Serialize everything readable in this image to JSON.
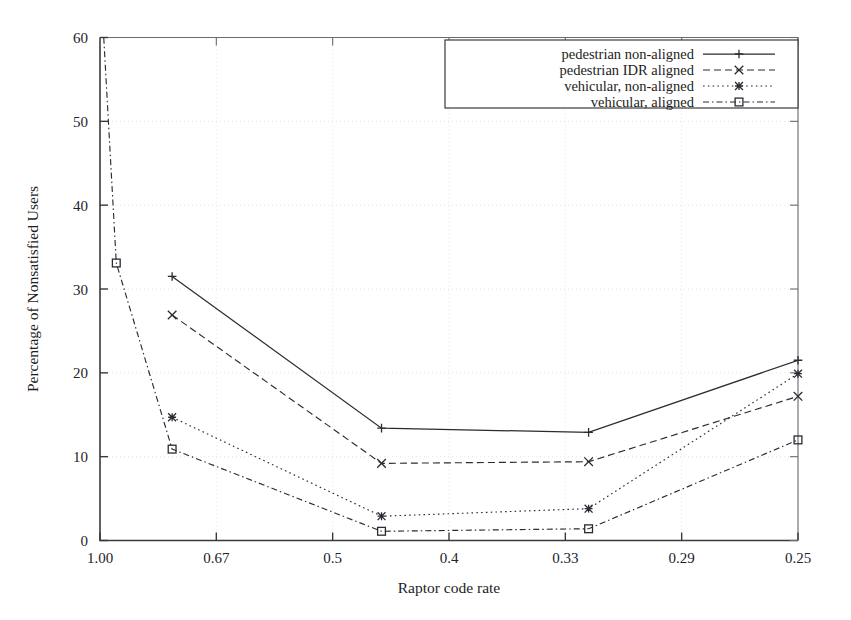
{
  "chart_data": {
    "type": "line",
    "title": "",
    "xlabel": "Raptor code rate",
    "ylabel": "Percentage of Nonsatisfied Users",
    "x_ticklabels": [
      "1.00",
      "0.67",
      "0.5",
      "0.4",
      "0.33",
      "0.29",
      "0.25"
    ],
    "x_tickvalues": [
      1,
      2,
      3,
      4,
      5,
      6,
      7
    ],
    "xlim": [
      1,
      7
    ],
    "y_ticklabels": [
      "0",
      "10",
      "20",
      "30",
      "40",
      "50",
      "60"
    ],
    "y_tickvalues": [
      0,
      10,
      20,
      30,
      40,
      50,
      60
    ],
    "ylim": [
      0,
      60
    ],
    "grid": true,
    "legend_position": "top-right",
    "x": [
      1.0,
      1.62,
      3.42,
      5.2,
      7.0
    ],
    "series": [
      {
        "name": "pedestrian non-aligned",
        "marker": "plus",
        "dash": "solid",
        "x": [
          1.62,
          3.42,
          5.2,
          7.0
        ],
        "values": [
          31.5,
          13.4,
          12.9,
          21.5
        ]
      },
      {
        "name": "pedestrian IDR aligned",
        "marker": "cross",
        "dash": "dashed",
        "x": [
          1.62,
          3.42,
          5.2,
          7.0
        ],
        "values": [
          26.9,
          9.2,
          9.4,
          17.2
        ]
      },
      {
        "name": "vehicular, non-aligned",
        "marker": "star",
        "dash": "dotted",
        "x": [
          1.62,
          3.42,
          5.2,
          7.0
        ],
        "values": [
          14.7,
          2.9,
          3.8,
          19.9
        ]
      },
      {
        "name": "vehicular, aligned",
        "marker": "square",
        "dash": "dashdot",
        "x": [
          1.0,
          1.14,
          1.62,
          3.42,
          5.2,
          7.0
        ],
        "values": [
          68.0,
          33.1,
          10.9,
          1.1,
          1.4,
          12.0
        ]
      }
    ]
  },
  "legend": {
    "items": [
      {
        "label": "pedestrian non-aligned"
      },
      {
        "label": "pedestrian IDR aligned"
      },
      {
        "label": "vehicular, non-aligned"
      },
      {
        "label": "vehicular, aligned"
      }
    ]
  },
  "colors": {
    "axis": "#3a3a3a",
    "grid": "#d8d8dc",
    "series": "#2b2b33",
    "background": "#ffffff"
  }
}
